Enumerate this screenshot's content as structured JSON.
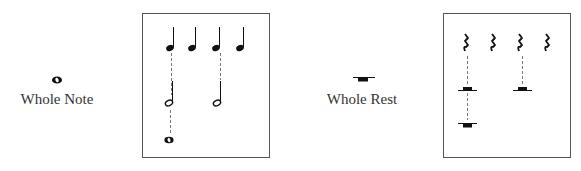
{
  "left": {
    "symbol": "whole-note",
    "label": "Whole Note",
    "diagram": {
      "row1": "4 quarter notes",
      "row2": "2 half notes",
      "row3": "1 whole note"
    }
  },
  "right": {
    "symbol": "whole-rest",
    "label": "Whole Rest",
    "diagram": {
      "row1": "4 quarter rests",
      "row2": "2 half rests",
      "row3": "1 whole rest"
    }
  }
}
